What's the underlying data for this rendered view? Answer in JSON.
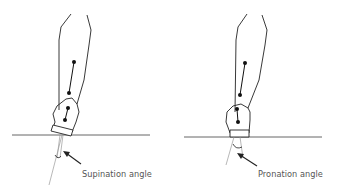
{
  "figure": {
    "panels": [
      {
        "id": "supination",
        "label": "Supination angle"
      },
      {
        "id": "pronation",
        "label": "Pronation angle"
      }
    ],
    "colors": {
      "line": "#222222",
      "ground": "#555555",
      "axis": "#999999",
      "text": "#555555",
      "marker": "#111111"
    }
  }
}
